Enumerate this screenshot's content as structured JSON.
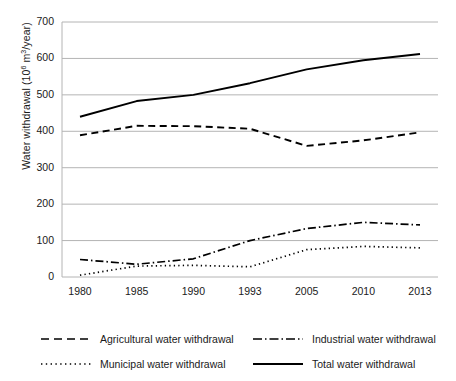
{
  "chart_data": {
    "type": "line",
    "title": "",
    "xlabel": "",
    "ylabel": "Water withdrawal (10⁶ m³/year)",
    "ylabel_parts": {
      "prefix": "Water withdrawal (10",
      "exponent": "6",
      "middle": " m",
      "exponent2": "3",
      "suffix": "/year)"
    },
    "categories": [
      "1980",
      "1985",
      "1990",
      "1993",
      "2005",
      "2010",
      "2013"
    ],
    "ylim": [
      0,
      700
    ],
    "ytick_labels": [
      "0",
      "100",
      "200",
      "300",
      "400",
      "500",
      "600",
      "700"
    ],
    "ytick_values": [
      0,
      100,
      200,
      300,
      400,
      500,
      600,
      700
    ],
    "grid": "horizontal",
    "legend_position": "bottom",
    "series": [
      {
        "name": "Agricultural water withdrawal",
        "style": "dashed",
        "color": "#000000",
        "values": [
          389,
          415,
          414,
          407,
          360,
          375,
          397
        ]
      },
      {
        "name": "Industrial water withdrawal",
        "style": "dash-dot",
        "color": "#000000",
        "values": [
          48,
          35,
          50,
          100,
          133,
          150,
          143
        ]
      },
      {
        "name": "Municipal water withdrawal",
        "style": "dotted",
        "color": "#000000",
        "values": [
          5,
          30,
          32,
          28,
          75,
          84,
          80
        ]
      },
      {
        "name": "Total water withdrawal",
        "style": "solid",
        "color": "#000000",
        "values": [
          440,
          483,
          500,
          532,
          570,
          595,
          612
        ]
      }
    ]
  },
  "legend": {
    "rows": [
      [
        {
          "label": "Agricultural water withdrawal",
          "style": "dashed"
        },
        {
          "label": "Industrial water withdrawal",
          "style": "dash-dot"
        }
      ],
      [
        {
          "label": "Municipal water withdrawal",
          "style": "dotted"
        },
        {
          "label": "Total water withdrawal",
          "style": "solid"
        }
      ]
    ]
  }
}
